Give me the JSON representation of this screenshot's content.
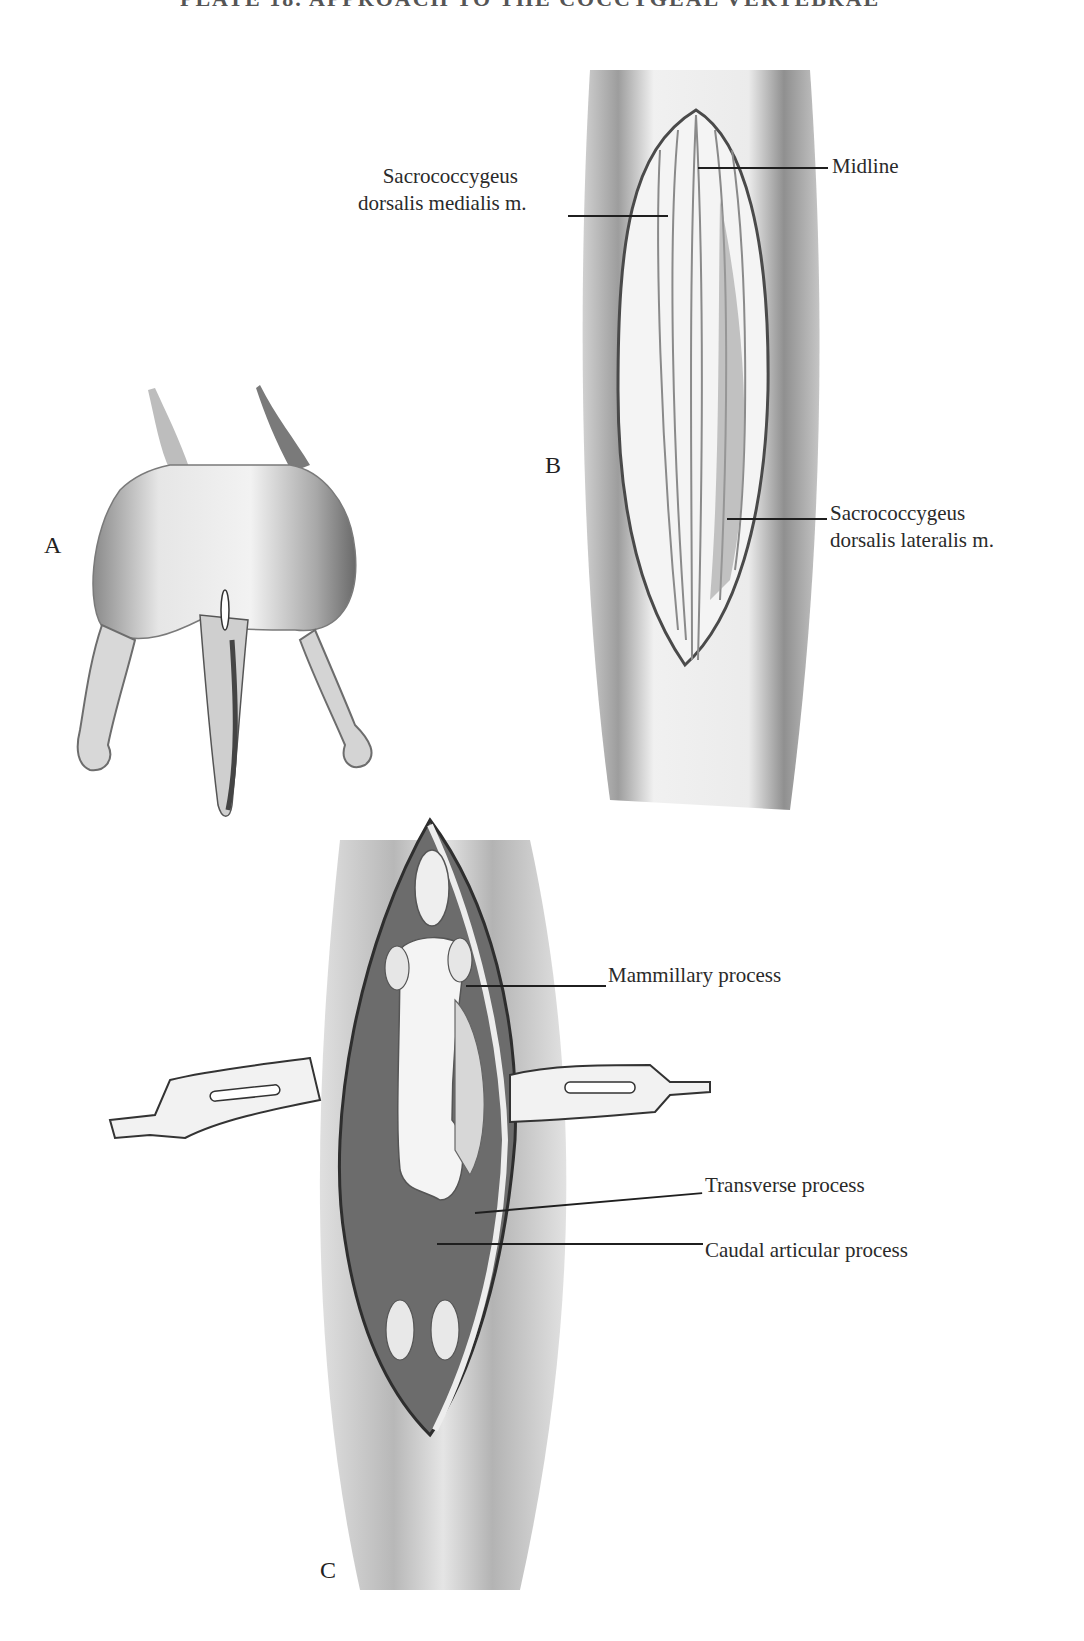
{
  "plate": {
    "title": "PLATE 18.  APPROACH TO THE COCCYGEAL VERTEBRAE"
  },
  "figures": [
    {
      "letter": "A",
      "description": "Dorsal view of dog hindquarters and tail with small midline skin incision at tail base",
      "labels": []
    },
    {
      "letter": "B",
      "description": "Skin incision opened exposing tail musculature",
      "labels": [
        {
          "line1": "Sacrococcygeus",
          "line2": "dorsalis medialis m."
        },
        {
          "line1": "Midline"
        },
        {
          "line1": "Sacrococcygeus",
          "line2": "dorsalis lateralis m."
        }
      ]
    },
    {
      "letter": "C",
      "description": "Retractors holding muscles apart exposing coccygeal vertebra",
      "labels": [
        {
          "line1": "Mammillary process"
        },
        {
          "line1": "Transverse process"
        },
        {
          "line1": "Caudal articular process"
        }
      ]
    }
  ],
  "colors": {
    "ink": "#222222",
    "shade_dark": "#6a6a6a",
    "shade_mid": "#9a9a9a",
    "shade_light": "#cfcfcf",
    "paper": "#ffffff"
  }
}
